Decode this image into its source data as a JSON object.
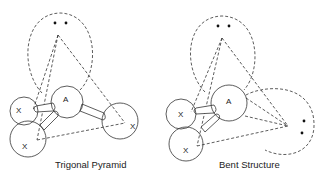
{
  "figures": [
    {
      "name": "trigonal-pyramid",
      "caption": "Trigonal Pyramid",
      "central_atom": "A",
      "ligands": [
        "X",
        "X",
        "X"
      ],
      "lone_pairs": 1
    },
    {
      "name": "bent-structure",
      "caption": "Bent Structure",
      "central_atom": "A",
      "ligands": [
        "X",
        "X"
      ],
      "lone_pairs": 2
    }
  ],
  "colors": {
    "line": "#333333",
    "background": "#ffffff"
  }
}
